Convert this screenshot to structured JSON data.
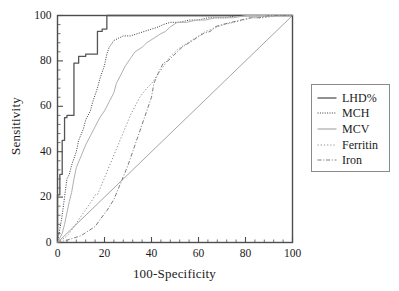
{
  "chart_data": {
    "type": "line",
    "title": "",
    "subtitle": "",
    "xlabel": "100-Specificity",
    "ylabel": "Sensitivity",
    "xlim": [
      0,
      100
    ],
    "ylim": [
      0,
      100
    ],
    "xticks": [
      0,
      20,
      40,
      60,
      80,
      100
    ],
    "yticks": [
      0,
      20,
      40,
      60,
      80,
      100
    ],
    "xtick_labels": [
      "0",
      "20",
      "40",
      "60",
      "80",
      "100"
    ],
    "ytick_labels": [
      "0",
      "20",
      "40",
      "60",
      "80",
      "100"
    ],
    "minor_ticks_per_interval": 4,
    "grid": false,
    "legend_position": "right-outside",
    "reference_line": {
      "name": "chance-diagonal",
      "x": [
        0,
        100
      ],
      "y": [
        0,
        100
      ],
      "color": "#9a9a9a"
    },
    "series": [
      {
        "name": "LHD%",
        "color": "#555555",
        "dash": "solid",
        "x": [
          0,
          0,
          1,
          1,
          2,
          2,
          3,
          3,
          4,
          4,
          7,
          7,
          9,
          9,
          12,
          12,
          17,
          17,
          19,
          19,
          21,
          21,
          100
        ],
        "y": [
          0,
          21,
          21,
          30,
          30,
          45,
          45,
          55,
          55,
          56,
          56,
          79,
          79,
          82,
          82,
          83,
          83,
          93,
          93,
          94,
          94,
          100,
          100
        ]
      },
      {
        "name": "MCH",
        "color": "#3a3a3a",
        "dash": "fine-dotted",
        "x": [
          0,
          1,
          2,
          3,
          4,
          5,
          6,
          8,
          9,
          11,
          12,
          14,
          15,
          17,
          18,
          20,
          21,
          22,
          24,
          26,
          28,
          31,
          34,
          37,
          40,
          43,
          45,
          48,
          52,
          56,
          60,
          64,
          68,
          72,
          76,
          80,
          84,
          88,
          92,
          96,
          100
        ],
        "y": [
          0,
          6,
          12,
          20,
          28,
          30,
          34,
          40,
          45,
          50,
          54,
          58,
          62,
          68,
          72,
          78,
          83,
          86,
          89,
          90,
          91,
          91,
          92,
          93,
          94,
          95,
          96,
          97,
          97,
          98,
          98,
          99,
          99,
          99,
          100,
          100,
          100,
          100,
          100,
          100,
          100
        ]
      },
      {
        "name": "MCV",
        "color": "#b0b0b0",
        "dash": "solid",
        "x": [
          0,
          2,
          3,
          4,
          5,
          6,
          7,
          8,
          10,
          12,
          14,
          16,
          18,
          20,
          22,
          24,
          25,
          27,
          29,
          31,
          33,
          36,
          38,
          41,
          44,
          46,
          48,
          51,
          55,
          59,
          63,
          67,
          71,
          75,
          80,
          85,
          90,
          95,
          100
        ],
        "y": [
          0,
          4,
          8,
          13,
          18,
          22,
          28,
          33,
          38,
          43,
          47,
          51,
          55,
          58,
          62,
          66,
          70,
          74,
          78,
          81,
          84,
          86,
          88,
          90,
          92,
          93,
          95,
          97,
          97,
          98,
          98,
          99,
          99,
          99,
          100,
          100,
          100,
          100,
          100
        ]
      },
      {
        "name": "Ferritin",
        "color": "#8c8c8c",
        "dash": "dotted",
        "x": [
          0,
          3,
          5,
          7,
          9,
          11,
          13,
          15,
          16,
          17,
          19,
          21,
          23,
          25,
          27,
          29,
          31,
          33,
          35,
          38,
          40,
          42,
          44,
          46,
          48,
          51,
          54,
          57,
          60,
          63,
          66,
          68,
          71,
          75,
          79,
          83,
          88,
          93,
          100
        ],
        "y": [
          0,
          2,
          4,
          7,
          10,
          13,
          16,
          19,
          21,
          21,
          26,
          31,
          36,
          41,
          46,
          51,
          56,
          60,
          64,
          68,
          70,
          73,
          76,
          79,
          82,
          85,
          87,
          89,
          91,
          93,
          94,
          95,
          96,
          97,
          98,
          99,
          99,
          100,
          100
        ]
      },
      {
        "name": "Iron",
        "color": "#7d7d7d",
        "dash": "dash-dot",
        "x": [
          0,
          4,
          7,
          10,
          13,
          16,
          18,
          21,
          24,
          26,
          28,
          30,
          32,
          34,
          36,
          38,
          40,
          41,
          43,
          45,
          47,
          50,
          53,
          56,
          59,
          62,
          65,
          67,
          70,
          74,
          78,
          82,
          86,
          90,
          95,
          100
        ],
        "y": [
          0,
          1,
          2,
          3,
          5,
          7,
          10,
          14,
          19,
          24,
          29,
          34,
          40,
          46,
          52,
          58,
          64,
          70,
          75,
          79,
          80,
          83,
          86,
          88,
          90,
          92,
          93,
          95,
          96,
          97,
          98,
          99,
          99,
          100,
          100,
          100
        ]
      }
    ],
    "legend_entries": [
      {
        "label": "LHD%",
        "dash": "solid",
        "color": "#555555"
      },
      {
        "label": "MCH",
        "dash": "fine-dotted",
        "color": "#3a3a3a"
      },
      {
        "label": "MCV",
        "dash": "solid",
        "color": "#b0b0b0"
      },
      {
        "label": "Ferritin",
        "dash": "dotted",
        "color": "#8c8c8c"
      },
      {
        "label": "Iron",
        "dash": "dash-dot",
        "color": "#7d7d7d"
      }
    ],
    "frame_color": "#4d4d4d",
    "text_color": "#1a1a1a"
  }
}
